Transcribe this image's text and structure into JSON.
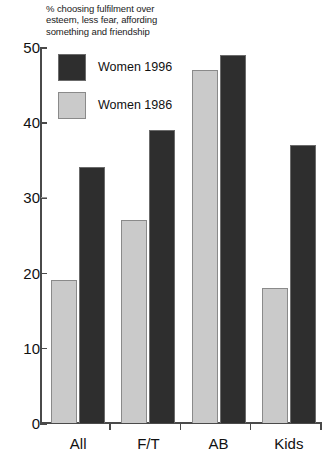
{
  "chart_data": {
    "type": "bar",
    "title": "% choosing fulfilment over\nesteem, less fear, affording\nsomething and friendship",
    "xlabel": "",
    "ylabel": "",
    "ylim": [
      0,
      50
    ],
    "yticks": [
      "0",
      "10",
      "20",
      "30",
      "40",
      "50"
    ],
    "grid": false,
    "legend_position": "top-left",
    "categories": [
      "All",
      "F/T",
      "AB",
      "Kids"
    ],
    "series": [
      {
        "name": "Women 1986",
        "color": "#cacaca",
        "values": [
          19,
          27,
          47,
          18
        ]
      },
      {
        "name": "Women 1996",
        "color": "#2e2e2e",
        "values": [
          34,
          39,
          49,
          37
        ]
      }
    ]
  },
  "legend": {
    "items": [
      {
        "label": "Women 1996",
        "swatch": "dark"
      },
      {
        "label": "Women 1986",
        "swatch": "light"
      }
    ]
  }
}
